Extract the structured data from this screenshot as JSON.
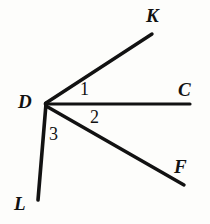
{
  "figure": {
    "kind": "geometry-angle-diagram",
    "canvas": {
      "width": 210,
      "height": 224
    },
    "background_color": "#fdfdfb",
    "stroke_color": "#121212",
    "stroke_width": 3.2
  },
  "vertex": {
    "name": "D",
    "label": "D",
    "x": 46,
    "y": 103
  },
  "rays": [
    {
      "id": "ray-DK",
      "endpoint_label": "K",
      "from": {
        "x": 46,
        "y": 103
      },
      "to": {
        "x": 152,
        "y": 34
      },
      "label_position": {
        "x": 146,
        "y": 6
      }
    },
    {
      "id": "ray-DC",
      "endpoint_label": "C",
      "from": {
        "x": 46,
        "y": 104
      },
      "to": {
        "x": 190,
        "y": 104
      },
      "label_position": {
        "x": 178,
        "y": 80
      }
    },
    {
      "id": "ray-DF",
      "endpoint_label": "F",
      "from": {
        "x": 46,
        "y": 106
      },
      "to": {
        "x": 184,
        "y": 185
      },
      "label_position": {
        "x": 174,
        "y": 157
      }
    },
    {
      "id": "ray-DL",
      "endpoint_label": "L",
      "from": {
        "x": 46,
        "y": 104
      },
      "to": {
        "x": 38,
        "y": 200
      },
      "label_position": {
        "x": 14,
        "y": 194
      }
    }
  ],
  "point_labels": {
    "D": "D",
    "K": "K",
    "C": "C",
    "F": "F",
    "L": "L"
  },
  "angle_labels": [
    {
      "id": "angle-1",
      "text": "1",
      "between": "DK and DC",
      "x": 80,
      "y": 80
    },
    {
      "id": "angle-2",
      "text": "2",
      "between": "DC and DF",
      "x": 90,
      "y": 108
    },
    {
      "id": "angle-3",
      "text": "3",
      "between": "DF and DL",
      "x": 49,
      "y": 125
    }
  ]
}
